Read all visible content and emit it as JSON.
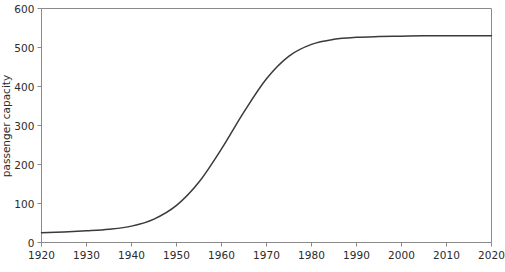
{
  "chart_data": {
    "type": "line",
    "title": "",
    "xlabel": "",
    "ylabel": "passenger capacity",
    "xlim": [
      1920,
      2020
    ],
    "ylim": [
      0,
      600
    ],
    "grid": false,
    "legend": null,
    "xticks": [
      1920,
      1930,
      1940,
      1950,
      1960,
      1970,
      1980,
      1990,
      2000,
      2010,
      2020
    ],
    "xtick_labels": [
      "1920",
      "1930",
      "1940",
      "1950",
      "1960",
      "1970",
      "1980",
      "1990",
      "2000",
      "2010",
      "2020"
    ],
    "yticks": [
      0,
      100,
      200,
      300,
      400,
      500,
      600
    ],
    "ytick_labels": [
      "0",
      "100",
      "200",
      "300",
      "400",
      "500",
      "600"
    ],
    "line_color": "#3a3a3a",
    "axis_color": "#8a8a8a",
    "background_color": "#ffffff",
    "series": [
      {
        "name": "passenger capacity",
        "x": [
          1920,
          1925,
          1930,
          1935,
          1940,
          1945,
          1950,
          1955,
          1960,
          1965,
          1970,
          1975,
          1980,
          1985,
          1990,
          1995,
          2000,
          2005,
          2010,
          2015,
          2020
        ],
        "values": [
          25,
          27,
          30,
          34,
          42,
          60,
          95,
          155,
          240,
          335,
          420,
          478,
          508,
          521,
          526,
          528,
          529,
          530,
          530,
          530,
          530
        ]
      }
    ]
  },
  "axes": {
    "ylabel_text": "passenger capacity"
  }
}
